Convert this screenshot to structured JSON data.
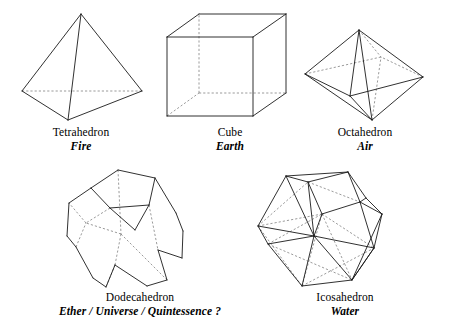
{
  "page": {
    "background_color": "#ffffff",
    "line_color": "#1a1a1a",
    "hidden_line_color": "#7a7a7a",
    "width": 453,
    "height": 331
  },
  "solids": [
    {
      "id": "tetrahedron",
      "name": "Tetrahedron",
      "element": "Fire",
      "faces": 4,
      "caption_left": 22,
      "caption_top": 126,
      "caption_width": 118,
      "svg": {
        "left": 18,
        "top": 10,
        "width": 130,
        "height": 112
      },
      "vertices": {
        "apex": [
          63,
          4
        ],
        "left": [
          4,
          81
        ],
        "right": [
          124,
          81
        ],
        "front": [
          50,
          110
        ]
      },
      "visible_edges": [
        [
          "apex",
          "left"
        ],
        [
          "apex",
          "right"
        ],
        [
          "apex",
          "front"
        ],
        [
          "left",
          "front"
        ],
        [
          "right",
          "front"
        ]
      ],
      "hidden_edges": [
        [
          "left",
          "right"
        ]
      ]
    },
    {
      "id": "cube",
      "name": "Cube",
      "element": "Earth",
      "faces": 6,
      "caption_left": 186,
      "caption_top": 126,
      "caption_width": 88,
      "svg": {
        "left": 163,
        "top": 11,
        "width": 128,
        "height": 110
      },
      "vertices": {
        "front_tl": [
          4,
          26
        ],
        "front_tr": [
          90,
          26
        ],
        "front_br": [
          90,
          105
        ],
        "front_bl": [
          4,
          105
        ],
        "back_tl": [
          36,
          3
        ],
        "back_tr": [
          123,
          3
        ],
        "back_br": [
          123,
          82
        ],
        "back_bl": [
          36,
          82
        ]
      },
      "visible_edges": [
        [
          "front_tl",
          "front_tr"
        ],
        [
          "front_tr",
          "front_br"
        ],
        [
          "front_br",
          "front_bl"
        ],
        [
          "front_bl",
          "front_tl"
        ],
        [
          "back_tl",
          "back_tr"
        ],
        [
          "back_tr",
          "back_br"
        ],
        [
          "front_tl",
          "back_tl"
        ],
        [
          "front_tr",
          "back_tr"
        ],
        [
          "front_br",
          "back_br"
        ]
      ],
      "hidden_edges": [
        [
          "back_bl",
          "back_tl"
        ],
        [
          "back_bl",
          "back_br"
        ],
        [
          "front_bl",
          "back_bl"
        ]
      ]
    },
    {
      "id": "octahedron",
      "name": "Octahedron",
      "element": "Air",
      "faces": 8,
      "caption_left": 311,
      "caption_top": 126,
      "caption_width": 108,
      "svg": {
        "left": 303,
        "top": 28,
        "width": 122,
        "height": 94
      },
      "vertices": {
        "top": [
          56,
          2
        ],
        "bottom": [
          69,
          92
        ],
        "left": [
          2,
          46
        ],
        "right": [
          120,
          49
        ],
        "front": [
          47,
          68
        ],
        "back": [
          78,
          29
        ]
      },
      "visible_edges": [
        [
          "top",
          "left"
        ],
        [
          "top",
          "right"
        ],
        [
          "top",
          "front"
        ],
        [
          "left",
          "front"
        ],
        [
          "right",
          "front"
        ],
        [
          "bottom",
          "left"
        ],
        [
          "bottom",
          "right"
        ],
        [
          "bottom",
          "front"
        ],
        [
          "top",
          "bottom"
        ]
      ],
      "hidden_edges": [
        [
          "left",
          "back"
        ],
        [
          "right",
          "back"
        ],
        [
          "top",
          "back"
        ],
        [
          "bottom",
          "back"
        ]
      ]
    },
    {
      "id": "dodecahedron",
      "name": "Dodecahedron",
      "element": "Ether / Universe / Quintessence ?",
      "faces": 12,
      "caption_left": 44,
      "caption_top": 291,
      "caption_width": 192,
      "svg": {
        "left": 63,
        "top": 168,
        "width": 124,
        "height": 122
      },
      "vertices": {
        "t0": [
          55,
          2
        ],
        "t1": [
          92,
          10
        ],
        "t2": [
          86,
          37
        ],
        "t3": [
          47,
          40
        ],
        "t4": [
          28,
          20
        ],
        "u0": [
          6,
          35
        ],
        "u1": [
          13,
          79
        ],
        "u2": [
          52,
          97
        ],
        "u3": [
          95,
          82
        ],
        "u4": [
          113,
          45
        ],
        "m0": [
          4,
          68
        ],
        "m1": [
          43,
          119
        ],
        "m2": [
          104,
          112
        ],
        "m3": [
          120,
          63
        ],
        "b0": [
          30,
          110
        ],
        "b1": [
          84,
          118
        ],
        "b2": [
          119,
          90
        ],
        "b3": [
          58,
          66
        ],
        "b4": [
          23,
          55
        ],
        "c0": [
          72,
          62
        ]
      },
      "visible_edges": [
        [
          "t0",
          "t1"
        ],
        [
          "t1",
          "t2"
        ],
        [
          "t2",
          "t3"
        ],
        [
          "t3",
          "t4"
        ],
        [
          "t4",
          "t0"
        ],
        [
          "t1",
          "u4"
        ],
        [
          "t4",
          "u0"
        ],
        [
          "u0",
          "m0"
        ],
        [
          "m0",
          "u1"
        ],
        [
          "u1",
          "b0"
        ],
        [
          "b0",
          "m1"
        ],
        [
          "m1",
          "u2"
        ],
        [
          "u2",
          "b1"
        ],
        [
          "b1",
          "m2"
        ],
        [
          "m2",
          "u3"
        ],
        [
          "u3",
          "b2"
        ],
        [
          "b2",
          "m3"
        ],
        [
          "m3",
          "u4"
        ],
        [
          "t2",
          "c0"
        ],
        [
          "t3",
          "c0"
        ]
      ],
      "hidden_edges": [
        [
          "t0",
          "b3"
        ],
        [
          "b3",
          "b4"
        ],
        [
          "b4",
          "u0"
        ],
        [
          "b3",
          "u2"
        ],
        [
          "t2",
          "u3"
        ],
        [
          "t3",
          "b4"
        ],
        [
          "u1",
          "b4"
        ],
        [
          "u2",
          "m1"
        ],
        [
          "b3",
          "m2"
        ]
      ]
    },
    {
      "id": "icosahedron",
      "name": "Icosahedron",
      "element": "Water",
      "faces": 20,
      "caption_left": 283,
      "caption_top": 291,
      "caption_width": 124,
      "svg": {
        "left": 256,
        "top": 170,
        "width": 134,
        "height": 122
      },
      "vertices": {
        "a": [
          30,
          6
        ],
        "b": [
          92,
          2
        ],
        "c": [
          2,
          56
        ],
        "d": [
          52,
          12
        ],
        "e": [
          110,
          28
        ],
        "f": [
          126,
          44
        ],
        "g": [
          58,
          66
        ],
        "h": [
          104,
          32
        ],
        "i": [
          12,
          74
        ],
        "j": [
          46,
          116
        ],
        "k": [
          96,
          110
        ],
        "l": [
          118,
          78
        ],
        "m": [
          66,
          44
        ]
      },
      "visible_edges": [
        [
          "a",
          "b"
        ],
        [
          "a",
          "d"
        ],
        [
          "d",
          "b"
        ],
        [
          "a",
          "c"
        ],
        [
          "c",
          "i"
        ],
        [
          "i",
          "j"
        ],
        [
          "j",
          "k"
        ],
        [
          "k",
          "l"
        ],
        [
          "l",
          "f"
        ],
        [
          "f",
          "e"
        ],
        [
          "e",
          "b"
        ],
        [
          "b",
          "h"
        ],
        [
          "h",
          "e"
        ],
        [
          "a",
          "g"
        ],
        [
          "d",
          "g"
        ],
        [
          "c",
          "g"
        ],
        [
          "g",
          "i"
        ],
        [
          "g",
          "j"
        ],
        [
          "g",
          "k"
        ],
        [
          "g",
          "l"
        ],
        [
          "k",
          "f"
        ],
        [
          "l",
          "k"
        ],
        [
          "h",
          "l"
        ],
        [
          "h",
          "f"
        ],
        [
          "d",
          "m"
        ],
        [
          "m",
          "h"
        ],
        [
          "g",
          "m"
        ]
      ],
      "hidden_edges": [
        [
          "c",
          "d"
        ],
        [
          "d",
          "h"
        ],
        [
          "c",
          "m"
        ],
        [
          "i",
          "m"
        ],
        [
          "m",
          "l"
        ],
        [
          "j",
          "m"
        ],
        [
          "c",
          "j"
        ],
        [
          "i",
          "k"
        ],
        [
          "j",
          "l"
        ],
        [
          "m",
          "k"
        ]
      ]
    }
  ]
}
